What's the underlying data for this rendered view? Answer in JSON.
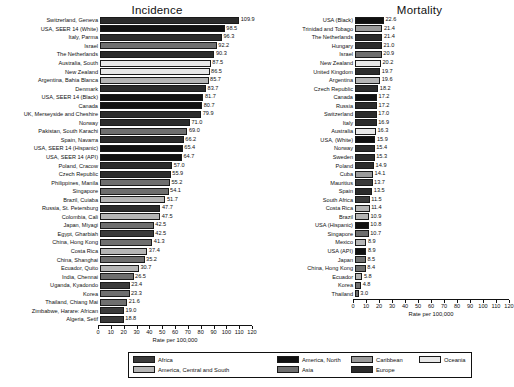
{
  "axis": {
    "title": "Rate per 100,000",
    "ticks": [
      0,
      10,
      20,
      30,
      40,
      50,
      60,
      70,
      80,
      90,
      100,
      110,
      120
    ],
    "max": 120
  },
  "colors": {
    "africa": "#3a3a3a",
    "america_north": "#111111",
    "caribbean": "#9a9a9a",
    "oceania": "#e8e8e8",
    "america_central_south": "#b5b5b5",
    "asia": "#6e6e6e",
    "europe": "#2b2b2b"
  },
  "legend": {
    "items": [
      {
        "label": "Africa",
        "key": "africa"
      },
      {
        "label": "America, Central and South",
        "key": "america_central_south"
      },
      {
        "label": "America, North",
        "key": "america_north"
      },
      {
        "label": "Asia",
        "key": "asia"
      },
      {
        "label": "Caribbean",
        "key": "caribbean"
      },
      {
        "label": "Europe",
        "key": "europe"
      },
      {
        "label": "Oceania",
        "key": "oceania"
      }
    ]
  },
  "chart_data": {
    "type": "bar",
    "title": "",
    "xlabel": "Rate per 100,000",
    "ylabel": "",
    "xlim": [
      0,
      120
    ],
    "grid": false,
    "legend_position": "bottom",
    "panels": [
      {
        "title": "Incidence",
        "categories": [
          "Switzerland, Geneva",
          "USA, SEER 14 (White)",
          "Italy, Parma",
          "Israel",
          "The Netherlands",
          "Australia, South",
          "New Zealand",
          "Argentina, Bahia Blanca",
          "Denmark",
          "USA, SEER 14 (Black)",
          "Canada",
          "UK, Merseyside and Cheshire",
          "Norway",
          "Pakistan, South Karachi",
          "Spain, Navarra",
          "USA, SEER 14 (Hispanic)",
          "USA, SEER 14 (API)",
          "Poland, Cracow",
          "Czech Republic",
          "Philippines, Manila",
          "Singapore",
          "Brazil, Cuiaba",
          "Russia, St. Petersburg",
          "Colombia, Cali",
          "Japan, Miyagi",
          "Egypt, Gharbiah",
          "China, Hong Kong",
          "Costa Rica",
          "China, Shanghai",
          "Ecuador, Quito",
          "India, Chennai",
          "Uganda, Kyadondo",
          "Korea",
          "Thailand, Chiang Mai",
          "Zimbabwe, Harare: African",
          "Algeria, Setif"
        ],
        "values": [
          109.9,
          98.5,
          96.3,
          92.2,
          90.3,
          87.5,
          86.5,
          85.7,
          83.7,
          81.7,
          80.7,
          79.9,
          71.0,
          69.0,
          66.2,
          65.4,
          64.7,
          57.0,
          55.9,
          55.2,
          54.1,
          51.7,
          47.7,
          47.5,
          42.5,
          42.5,
          41.3,
          37.4,
          35.2,
          30.7,
          26.5,
          23.4,
          23.3,
          21.6,
          19.0,
          18.8
        ],
        "groups": [
          "europe",
          "america_north",
          "europe",
          "asia",
          "europe",
          "oceania",
          "oceania",
          "america_central_south",
          "europe",
          "america_north",
          "america_north",
          "europe",
          "europe",
          "asia",
          "europe",
          "america_north",
          "america_north",
          "europe",
          "europe",
          "asia",
          "asia",
          "america_central_south",
          "europe",
          "america_central_south",
          "asia",
          "africa",
          "asia",
          "america_central_south",
          "asia",
          "america_central_south",
          "asia",
          "africa",
          "asia",
          "asia",
          "africa",
          "africa"
        ]
      },
      {
        "title": "Mortality",
        "categories": [
          "USA (Black)",
          "Trinidad and Tobago",
          "The Netherlands",
          "Hungary",
          "Israel",
          "New Zealand",
          "United Kingdom",
          "Argentina",
          "Czech Republic",
          "Canada",
          "Russia",
          "Switzerland",
          "Italy",
          "Australia",
          "USA, (White)",
          "Norway",
          "Sweden",
          "Poland",
          "Cuba",
          "Mauritius",
          "Spain",
          "South Africa",
          "Costa Rica",
          "Brazil",
          "USA (Hispanic)",
          "Singapore",
          "Mexico",
          "USA (API)",
          "Japan",
          "China, Hong Kong",
          "Ecuador",
          "Korea",
          "Thailand"
        ],
        "values": [
          22.6,
          21.4,
          21.4,
          21.0,
          20.9,
          20.2,
          19.7,
          19.6,
          18.2,
          17.2,
          17.2,
          17.0,
          16.9,
          16.3,
          15.9,
          15.4,
          15.3,
          14.9,
          14.1,
          13.7,
          13.5,
          11.5,
          11.4,
          10.9,
          10.8,
          10.7,
          8.9,
          8.9,
          8.5,
          8.4,
          5.8,
          4.8,
          3.0
        ],
        "groups": [
          "america_north",
          "caribbean",
          "europe",
          "europe",
          "asia",
          "oceania",
          "europe",
          "america_central_south",
          "europe",
          "america_north",
          "europe",
          "europe",
          "europe",
          "oceania",
          "america_north",
          "europe",
          "europe",
          "europe",
          "caribbean",
          "africa",
          "europe",
          "africa",
          "america_central_south",
          "america_central_south",
          "america_north",
          "asia",
          "america_central_south",
          "america_north",
          "asia",
          "asia",
          "america_central_south",
          "asia",
          "asia"
        ]
      }
    ]
  }
}
